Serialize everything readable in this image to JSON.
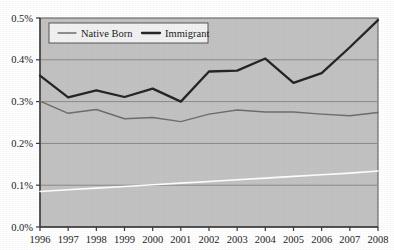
{
  "chart_data": {
    "type": "line",
    "title": "",
    "subtitle": "",
    "xlabel": "",
    "ylabel": "",
    "categories": [
      "1996",
      "1997",
      "1998",
      "1999",
      "2000",
      "2001",
      "2002",
      "2003",
      "2004",
      "2005",
      "2006",
      "2007",
      "2008"
    ],
    "x": [
      1996,
      1997,
      1998,
      1999,
      2000,
      2001,
      2002,
      2003,
      2004,
      2005,
      2006,
      2007,
      2008
    ],
    "ylim": [
      0.0,
      0.5
    ],
    "ytick_values": [
      0.0,
      0.1,
      0.2,
      0.3,
      0.4,
      0.5
    ],
    "ytick_labels": [
      "0.0%",
      "0.1%",
      "0.2%",
      "0.3%",
      "0.4%",
      "0.5%"
    ],
    "xtick_labels": [
      "1996",
      "1997",
      "1998",
      "1999",
      "2000",
      "2001",
      "2002",
      "2003",
      "2004",
      "2005",
      "2006",
      "2007",
      "2008"
    ],
    "grid": true,
    "grid_axis": "y",
    "legend_position": "top-center",
    "plot_background": "#c3c3c3",
    "figure_background": "#ffffff",
    "series": [
      {
        "name": "Native Born",
        "color": "#6e6e6e",
        "line_width": 1.4,
        "values": [
          0.301,
          0.272,
          0.281,
          0.259,
          0.262,
          0.252,
          0.27,
          0.28,
          0.275,
          0.275,
          0.27,
          0.266,
          0.274
        ]
      },
      {
        "name": "Immigrant",
        "color": "#262626",
        "line_width": 2.3,
        "values": [
          0.362,
          0.31,
          0.327,
          0.311,
          0.331,
          0.3,
          0.372,
          0.374,
          0.403,
          0.345,
          0.368,
          0.43,
          0.495
        ]
      },
      {
        "name": "trend-line",
        "color": "#ffffff",
        "line_width": 1.6,
        "in_legend": false,
        "values": [
          0.085,
          0.089,
          0.093,
          0.097,
          0.101,
          0.105,
          0.109,
          0.113,
          0.117,
          0.121,
          0.125,
          0.129,
          0.134
        ]
      }
    ]
  },
  "legend": {
    "entries": [
      {
        "label": "Native Born",
        "color": "#6e6e6e"
      },
      {
        "label": "Immigrant",
        "color": "#262626"
      }
    ]
  },
  "axes": {
    "y_axis_color": "#3a3a3a",
    "x_axis_color": "#3a3a3a",
    "gridline_color": "#8a8a8a"
  }
}
